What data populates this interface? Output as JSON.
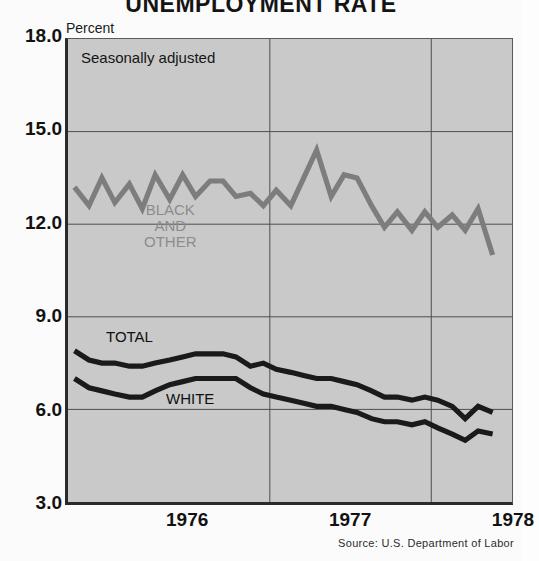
{
  "chart_data": {
    "type": "line",
    "title": "UNEMPLOYMENT RATE",
    "subtitle": "Seasonally adjusted",
    "xlabel": "",
    "ylabel": "Percent",
    "ylim": [
      3.0,
      18.0
    ],
    "yticks": [
      18.0,
      15.0,
      12.0,
      9.0,
      6.0,
      3.0
    ],
    "ytick_labels": [
      "18.0",
      "15.0",
      "12.0",
      "9.0",
      "6.0",
      "3.0"
    ],
    "xticks": [
      1976,
      1977,
      1978
    ],
    "xtick_labels": [
      "1976",
      "1977",
      "1978"
    ],
    "xlim": [
      1975.75,
      1978.5
    ],
    "grid": true,
    "legend_position": "inline-annotations",
    "source": "Source: U.S. Department of Labor",
    "x": [
      1975.79,
      1975.88,
      1975.96,
      1976.04,
      1976.13,
      1976.21,
      1976.29,
      1976.38,
      1976.46,
      1976.54,
      1976.63,
      1976.71,
      1976.79,
      1976.88,
      1976.96,
      1977.04,
      1977.13,
      1977.21,
      1977.29,
      1977.38,
      1977.46,
      1977.54,
      1977.63,
      1977.71,
      1977.79,
      1977.88,
      1977.96,
      1978.04,
      1978.13,
      1978.21,
      1978.29,
      1978.38
    ],
    "series": [
      {
        "name": "BLACK AND OTHER",
        "color": "#7d7d7d",
        "values": [
          13.2,
          12.6,
          13.5,
          12.7,
          13.3,
          12.5,
          13.6,
          12.8,
          13.6,
          12.9,
          13.4,
          13.4,
          12.9,
          13.0,
          12.6,
          13.1,
          12.6,
          13.5,
          14.4,
          12.9,
          13.6,
          13.5,
          12.6,
          11.9,
          12.4,
          11.8,
          12.4,
          11.9,
          12.3,
          11.8,
          12.5,
          11.0
        ]
      },
      {
        "name": "TOTAL",
        "color": "#1a1a1a",
        "values": [
          7.9,
          7.6,
          7.5,
          7.5,
          7.4,
          7.4,
          7.5,
          7.6,
          7.7,
          7.8,
          7.8,
          7.8,
          7.7,
          7.4,
          7.5,
          7.3,
          7.2,
          7.1,
          7.0,
          7.0,
          6.9,
          6.8,
          6.6,
          6.4,
          6.4,
          6.3,
          6.4,
          6.3,
          6.1,
          5.7,
          6.1,
          5.9
        ]
      },
      {
        "name": "WHITE",
        "color": "#1a1a1a",
        "values": [
          7.0,
          6.7,
          6.6,
          6.5,
          6.4,
          6.4,
          6.6,
          6.8,
          6.9,
          7.0,
          7.0,
          7.0,
          7.0,
          6.7,
          6.5,
          6.4,
          6.3,
          6.2,
          6.1,
          6.1,
          6.0,
          5.9,
          5.7,
          5.6,
          5.6,
          5.5,
          5.6,
          5.4,
          5.2,
          5.0,
          5.3,
          5.2
        ]
      }
    ]
  },
  "annotations": {
    "seasonally_adjusted": "Seasonally adjusted",
    "black_and_other": "BLACK\nAND\nOTHER",
    "total": "TOTAL",
    "white": "WHITE"
  },
  "axis": {
    "y_unit": "Percent"
  },
  "footer": {
    "source": "Source: U.S. Department of Labor"
  },
  "colors": {
    "plot_background": "#c9c9c9",
    "page_background": "#fbfbfb",
    "grid": "#4d4d4d",
    "axis": "#2a2a2a",
    "series_black_other": "#7d7d7d",
    "series_dark": "#1a1a1a"
  }
}
